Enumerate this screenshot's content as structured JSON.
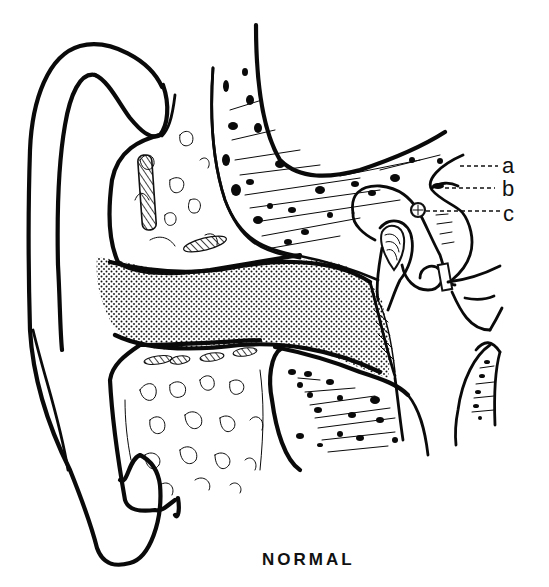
{
  "figure": {
    "caption": "NORMAL",
    "labels": [
      {
        "id": "a",
        "text": "a"
      },
      {
        "id": "b",
        "text": "b"
      },
      {
        "id": "c",
        "text": "c"
      }
    ],
    "regions": {
      "auricle": "outer ear (auricle)",
      "ear_canal": "external auditory canal (stippled)",
      "mastoid_upper": "air cells (upper)",
      "mastoid_lower": "air cells (lower)",
      "temporal_bone_upper": "temporal bone (upper, hatched)",
      "temporal_bone_lower": "temporal bone (lower, hatched)",
      "eardrum": "tympanic membrane",
      "ossicles": "middle ear ossicles",
      "eustachian_tube": "eustachian tube"
    }
  },
  "colors": {
    "ink": "#0a0a0a",
    "paper": "#ffffff"
  }
}
